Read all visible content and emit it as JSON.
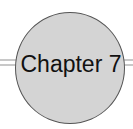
{
  "heading": {
    "label": "Chapter 7"
  },
  "colors": {
    "circle_fill": "#d4d4d4",
    "circle_border": "#555555",
    "rule": "#c8c8c8"
  }
}
